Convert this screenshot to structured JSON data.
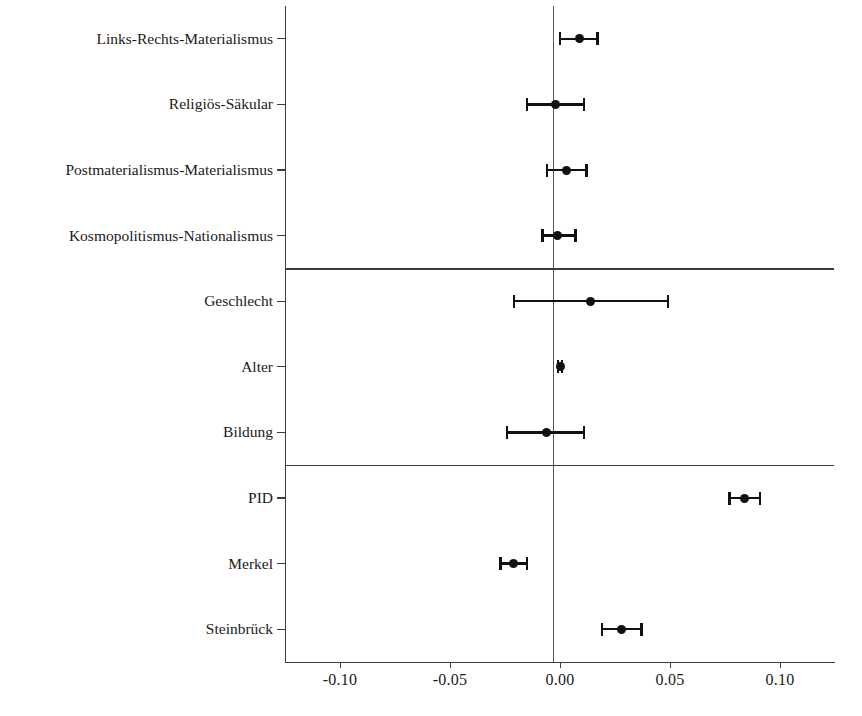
{
  "chart_data": {
    "type": "scatter",
    "plot_kind": "coefficient-forest-plot",
    "title": "",
    "subtitle": "",
    "xlabel": "",
    "ylabel": "",
    "xlim": [
      -0.125,
      0.125
    ],
    "xticks": [
      -0.1,
      -0.05,
      0.0,
      0.05,
      0.1
    ],
    "xticklabels": [
      "-0.10",
      "-0.05",
      "0.00",
      "0.05",
      "0.10"
    ],
    "grid": false,
    "legend": null,
    "reference_line": 0.0,
    "error_bar_note": "horizontal line = confidence interval, dot = point estimate",
    "group_separators_after": [
      "Kosmopolitismus-Nationalismus",
      "Bildung"
    ],
    "categories": [
      "Links-Rechts-Materialismus",
      "Religiös-Säkular",
      "Postmaterialismus-Materialismus",
      "Kosmopolitismus-Nationalismus",
      "Geschlecht",
      "Alter",
      "Bildung",
      "PID",
      "Merkel",
      "Steinbrück"
    ],
    "points": [
      {
        "label": "Links-Rechts-Materialismus",
        "estimate": 0.009,
        "ci_low": 0.0,
        "ci_high": 0.017
      },
      {
        "label": "Religiös-Säkular",
        "estimate": -0.002,
        "ci_low": -0.015,
        "ci_high": 0.011
      },
      {
        "label": "Postmaterialismus-Materialismus",
        "estimate": 0.003,
        "ci_low": -0.006,
        "ci_high": 0.012
      },
      {
        "label": "Kosmopolitismus-Nationalismus",
        "estimate": -0.001,
        "ci_low": -0.008,
        "ci_high": 0.007
      },
      {
        "label": "Geschlecht",
        "estimate": 0.014,
        "ci_low": -0.021,
        "ci_high": 0.049
      },
      {
        "label": "Alter",
        "estimate": 0.0,
        "ci_low": -0.001,
        "ci_high": 0.001
      },
      {
        "label": "Bildung",
        "estimate": -0.006,
        "ci_low": -0.024,
        "ci_high": 0.011
      },
      {
        "label": "PID",
        "estimate": 0.084,
        "ci_low": 0.077,
        "ci_high": 0.091
      },
      {
        "label": "Merkel",
        "estimate": -0.021,
        "ci_low": -0.027,
        "ci_high": -0.015
      },
      {
        "label": "Steinbrück",
        "estimate": 0.028,
        "ci_low": 0.019,
        "ci_high": 0.037
      }
    ]
  }
}
